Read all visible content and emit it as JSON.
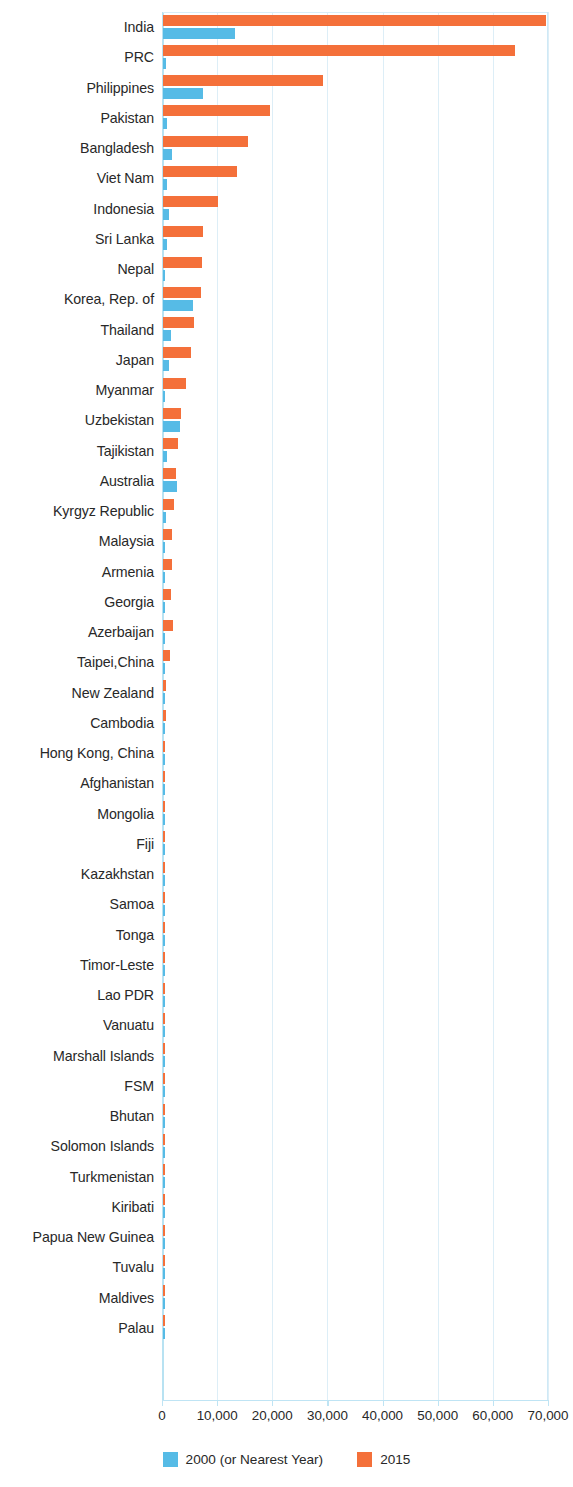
{
  "chart_data": {
    "type": "bar",
    "orientation": "horizontal",
    "title": "",
    "subtitle": "",
    "xlabel": "",
    "ylabel": "",
    "xlim": [
      0,
      70000
    ],
    "ylim": null,
    "grid": true,
    "legend_position": "bottom-center",
    "xticks": [
      "0",
      "10,000",
      "20,000",
      "30,000",
      "40,000",
      "50,000",
      "60,000",
      "70,000"
    ],
    "xtick_values": [
      0,
      10000,
      20000,
      30000,
      40000,
      50000,
      60000,
      70000
    ],
    "categories": [
      "India",
      "PRC",
      "Philippines",
      "Pakistan",
      "Bangladesh",
      "Viet Nam",
      "Indonesia",
      "Sri Lanka",
      "Nepal",
      "Korea, Rep. of",
      "Thailand",
      "Japan",
      "Myanmar",
      "Uzbekistan",
      "Tajikistan",
      "Australia",
      "Kyrgyz Republic",
      "Malaysia",
      "Armenia",
      "Georgia",
      "Azerbaijan",
      "Taipei,China",
      "New Zealand",
      "Cambodia",
      "Hong Kong, China",
      "Afghanistan",
      "Mongolia",
      "Fiji",
      "Kazakhstan",
      "Samoa",
      "Tonga",
      "Timor-Leste",
      "Lao PDR",
      "Vanuatu",
      "Marshall Islands",
      "FSM",
      "Bhutan",
      "Solomon Islands",
      "Turkmenistan",
      "Kiribati",
      "Papua New Guinea",
      "Tuvalu",
      "Maldives",
      "Palau"
    ],
    "series": [
      {
        "name": "2000 (or Nearest Year)",
        "color": "#56bbe6",
        "values": [
          13000,
          500,
          7200,
          800,
          1700,
          700,
          1000,
          800,
          300,
          5500,
          1500,
          1000,
          200,
          3000,
          700,
          2500,
          500,
          400,
          200,
          200,
          200,
          200,
          200,
          100,
          150,
          100,
          100,
          80,
          100,
          60,
          60,
          40,
          60,
          50,
          40,
          40,
          40,
          40,
          60,
          30,
          60,
          20,
          40,
          20
        ]
      },
      {
        "name": "2015",
        "color": "#f4703a",
        "values": [
          69500,
          63800,
          29000,
          19400,
          15400,
          13500,
          10000,
          7200,
          7000,
          6900,
          5600,
          5000,
          4100,
          3300,
          2800,
          2400,
          2000,
          1700,
          1600,
          1400,
          1900,
          1200,
          600,
          500,
          450,
          450,
          400,
          350,
          450,
          300,
          280,
          260,
          350,
          260,
          240,
          240,
          260,
          240,
          280,
          220,
          300,
          180,
          240,
          180
        ]
      }
    ]
  },
  "legend": {
    "items": [
      {
        "label": "2000 (or Nearest Year)",
        "color": "#56bbe6"
      },
      {
        "label": "2015",
        "color": "#f4703a"
      }
    ]
  },
  "colors": {
    "series_2000": "#56bbe6",
    "series_2015": "#f4703a",
    "gridline": "#ddeef7",
    "axis": "#b8e2f2",
    "text": "#282828",
    "background": "#ffffff"
  }
}
